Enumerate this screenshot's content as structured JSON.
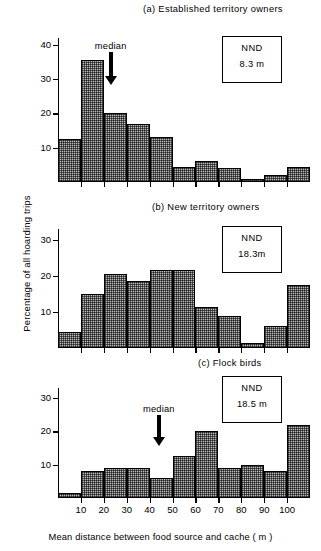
{
  "figure": {
    "ylabel": "Percentage of all hoarding trips",
    "xlabel": "Mean distance between food source and cache ( m )"
  },
  "chart_data": [
    {
      "type": "bar",
      "panel": "a",
      "title": "(a)  Established territory owners",
      "categories": [
        "0-10",
        "10-20",
        "20-30",
        "30-40",
        "40-50",
        "50-60",
        "60-70",
        "70-80",
        "80-90",
        "90-100",
        "100-110"
      ],
      "bin_edges": [
        0,
        10,
        20,
        30,
        40,
        50,
        60,
        70,
        80,
        90,
        100,
        110
      ],
      "values": [
        12.5,
        35.5,
        20,
        17,
        13,
        4.5,
        6,
        4,
        1,
        2,
        4.5
      ],
      "xlabel": "",
      "ylabel": "Percentage of all hoarding trips",
      "ylim": [
        0,
        42
      ],
      "yticks": [
        10,
        20,
        30,
        40
      ],
      "xticks": [
        10,
        20,
        30,
        40,
        50,
        60,
        70,
        80,
        90,
        100
      ],
      "xtick_labels_visible": false,
      "grid": false,
      "annotations": {
        "median_label": "median",
        "median_x": 23,
        "nnd_title": "NND",
        "nnd_value": "8.3 m"
      }
    },
    {
      "type": "bar",
      "panel": "b",
      "title": "(b)   New territory owners",
      "categories": [
        "0-10",
        "10-20",
        "20-30",
        "30-40",
        "40-50",
        "50-60",
        "60-70",
        "70-80",
        "80-90",
        "90-100",
        "100-110"
      ],
      "bin_edges": [
        0,
        10,
        20,
        30,
        40,
        50,
        60,
        70,
        80,
        90,
        100,
        110
      ],
      "values": [
        4.5,
        15,
        20.5,
        18.5,
        21.5,
        21.5,
        11.5,
        9,
        1.5,
        6,
        17.5
      ],
      "xlabel": "",
      "ylabel": "Percentage of all hoarding trips",
      "ylim": [
        0,
        33
      ],
      "yticks": [
        10,
        20,
        30
      ],
      "xticks": [
        10,
        20,
        30,
        40,
        50,
        60,
        70,
        80,
        90,
        100
      ],
      "xtick_labels_visible": false,
      "grid": false,
      "annotations": {
        "median_label": "median",
        "median_x": 44,
        "nnd_title": "NND",
        "nnd_value": "18.3m"
      }
    },
    {
      "type": "bar",
      "panel": "c",
      "title": "(c)  Flock birds",
      "categories": [
        "0-10",
        "10-20",
        "20-30",
        "30-40",
        "40-50",
        "50-60",
        "60-70",
        "70-80",
        "80-90",
        "90-100",
        "100-110"
      ],
      "bin_edges": [
        0,
        10,
        20,
        30,
        40,
        50,
        60,
        70,
        80,
        90,
        100,
        110
      ],
      "values": [
        1.5,
        8,
        9,
        9,
        6,
        12.5,
        20,
        9,
        10,
        8,
        22
      ],
      "xlabel": "Mean distance between food source and cache ( m )",
      "ylabel": "Percentage of all hoarding trips",
      "ylim": [
        0,
        33
      ],
      "yticks": [
        10,
        20,
        30
      ],
      "xticks": [
        10,
        20,
        30,
        40,
        50,
        60,
        70,
        80,
        90,
        100
      ],
      "xtick_labels_visible": true,
      "grid": false,
      "annotations": {
        "median_label": "median",
        "median_x": 62,
        "nnd_title": "NND",
        "nnd_value": "18.5 m"
      }
    }
  ]
}
